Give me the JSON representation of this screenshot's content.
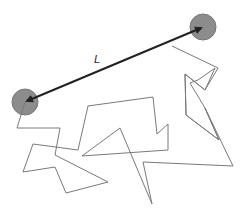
{
  "diagram": {
    "label": "L",
    "label_position": [
      96,
      53
    ],
    "colors": {
      "chain": "#7a7a7a",
      "arrow": "#222222",
      "end_fill": "#8c8c8c",
      "end_stroke": "#777777",
      "background": "#ffffff"
    },
    "ends": [
      {
        "name": "start",
        "cx": 25,
        "cy": 102,
        "r": 13
      },
      {
        "name": "end",
        "cx": 203,
        "cy": 27,
        "r": 13
      }
    ],
    "chain_points": "25,102 17,128 60,128 55,155 108,182 66,193 55,167 23,172 33,144 78,150 88,106 153,97 157,134 168,124 168,150 82,156 120,128 152,204 143,162 233,166 205,108 190,83 198,80 215,68 205,90 185,74 186,115 219,140 205,108",
    "chain_points_upper": "195,86 218,68 172,46 162,14 120,30 138,30 163,14 172,46",
    "arrow": {
      "x1": 25,
      "y1": 102,
      "x2": 203,
      "y2": 27
    }
  }
}
